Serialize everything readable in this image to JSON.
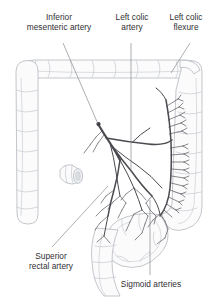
{
  "figure": {
    "background_color": "#ffffff",
    "artery_color": "#4a4a50",
    "bowel_outline_color": "#b9bcc2",
    "bowel_fill_color": "#f6f7f8",
    "leader_color": "#77797e",
    "text_color": "#2f2f33"
  },
  "labels": {
    "inferior_mesenteric_artery": "Inferior\nmesenteric artery",
    "left_colic_artery": "Left colic\nartery",
    "left_colic_flexure": "Left colic\nflexure",
    "superior_rectal_artery": "Superior\nrectal artery",
    "sigmoid_arteries": "Sigmoid arteries"
  },
  "structures": {
    "colon_segments": [
      "ascending colon",
      "transverse colon",
      "descending colon",
      "sigmoid colon",
      "rectum"
    ],
    "vessels": [
      "inferior mesenteric artery",
      "left colic artery",
      "marginal artery",
      "vasa recta",
      "sigmoid arteries",
      "superior rectal artery"
    ]
  }
}
